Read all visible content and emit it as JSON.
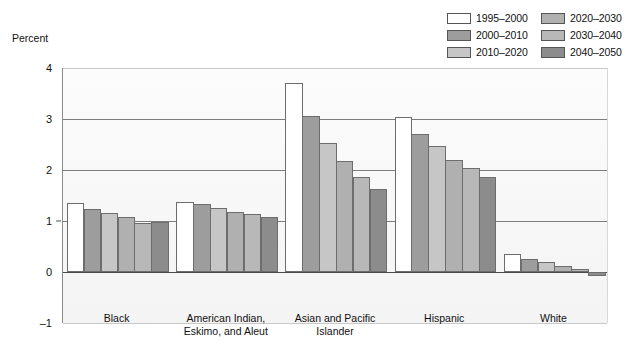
{
  "axis_title": "Percent",
  "legend": {
    "items": [
      {
        "label": "1995–2000",
        "color": "#ffffff"
      },
      {
        "label": "2000–2010",
        "color": "#9d9d9d"
      },
      {
        "label": "2010–2020",
        "color": "#c6c6c6"
      },
      {
        "label": "2020–2030",
        "color": "#b0b0b0"
      },
      {
        "label": "2030–2040",
        "color": "#b8b8b8"
      },
      {
        "label": "2040–2050",
        "color": "#8c8c8c"
      }
    ]
  },
  "chart_data": {
    "type": "bar",
    "title": "",
    "xlabel": "",
    "ylabel": "Percent",
    "ylim": [
      -1,
      4
    ],
    "yticks": [
      4,
      3,
      2,
      1,
      0,
      -1
    ],
    "ytick_labels": [
      "4",
      "3",
      "2",
      "1",
      "0",
      "–1"
    ],
    "grid": true,
    "legend_position": "top-right",
    "categories": [
      "Black",
      "American Indian,\nEskimo, and Aleut",
      "Asian and Pacific\nIslander",
      "Hispanic",
      "White"
    ],
    "category_lines": [
      [
        "Black"
      ],
      [
        "American Indian,",
        "Eskimo, and Aleut"
      ],
      [
        "Asian and Pacific",
        "Islander"
      ],
      [
        "Hispanic"
      ],
      [
        "White"
      ]
    ],
    "series": [
      {
        "name": "1995–2000",
        "color": "#ffffff",
        "values": [
          1.35,
          1.38,
          3.7,
          3.03,
          0.35
        ]
      },
      {
        "name": "2000–2010",
        "color": "#9d9d9d",
        "values": [
          1.24,
          1.33,
          3.05,
          2.7,
          0.25
        ]
      },
      {
        "name": "2010–2020",
        "color": "#c6c6c6",
        "values": [
          1.15,
          1.26,
          2.53,
          2.47,
          0.2
        ]
      },
      {
        "name": "2020–2030",
        "color": "#b0b0b0",
        "values": [
          1.07,
          1.18,
          2.17,
          2.2,
          0.12
        ]
      },
      {
        "name": "2030–2040",
        "color": "#b8b8b8",
        "values": [
          0.97,
          1.14,
          1.86,
          2.03,
          0.05
        ]
      },
      {
        "name": "2040–2050",
        "color": "#8c8c8c",
        "values": [
          0.99,
          1.07,
          1.62,
          1.87,
          -0.08
        ]
      }
    ]
  }
}
